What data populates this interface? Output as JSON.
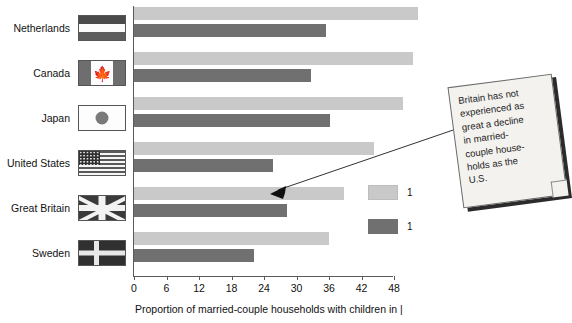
{
  "chart_data": {
    "type": "bar",
    "orientation": "horizontal",
    "title": "",
    "xlabel": "Proportion of married-couple households with children in |",
    "ylabel": "",
    "categories": [
      "Netherlands",
      "Canada",
      "Japan",
      "United States",
      "Great Britain",
      "Sweden"
    ],
    "xlim": [
      0,
      54
    ],
    "xticks": [
      0,
      6,
      12,
      18,
      24,
      30,
      36,
      42,
      48
    ],
    "grid": false,
    "legend_position": "right-middle",
    "series": [
      {
        "name": "1",
        "color": "#c9c9c9",
        "values": [
          52.5,
          51.5,
          49.7,
          44.3,
          38.7,
          36.0
        ]
      },
      {
        "name": "1",
        "color": "#707070",
        "values": [
          35.5,
          32.7,
          36.2,
          25.7,
          28.3,
          22.2
        ]
      }
    ],
    "annotations": [
      {
        "text": "Britain has not experienced as great a decline in married-couple house-holds as the U.S.",
        "lines": [
          "Britain has not",
          "experienced as",
          "great a decline",
          "in married-",
          "couple house-",
          "holds as the",
          "U.S."
        ],
        "points_to": "Great Britain"
      }
    ]
  },
  "flags": [
    {
      "country": "Netherlands",
      "icon": "netherlands-flag-icon"
    },
    {
      "country": "Canada",
      "icon": "canada-flag-icon"
    },
    {
      "country": "Japan",
      "icon": "japan-flag-icon"
    },
    {
      "country": "United States",
      "icon": "united-states-flag-icon"
    },
    {
      "country": "Great Britain",
      "icon": "great-britain-flag-icon"
    },
    {
      "country": "Sweden",
      "icon": "sweden-flag-icon"
    }
  ],
  "legend": {
    "entries": [
      {
        "label": "1",
        "color": "#c9c9c9"
      },
      {
        "label": "1",
        "color": "#707070"
      }
    ]
  },
  "colors": {
    "series_light": "#c9c9c9",
    "series_dark": "#707070",
    "axis": "#5a5a5a",
    "note_paper": "#f3f2ef",
    "note_shadow": "#2b2b2b",
    "text": "#111111"
  }
}
